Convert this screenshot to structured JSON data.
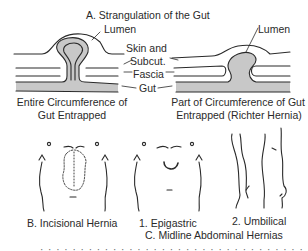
{
  "figure": {
    "panel_a": {
      "title": "A. Strangulation of the Gut",
      "left_caption": [
        "Entire Circumference of",
        "Gut Entrapped"
      ],
      "right_caption": [
        "Part of Circumference of Gut",
        "Entrapped (Richter Hernia)"
      ],
      "layer_labels": {
        "lumen_left": "Lumen",
        "lumen_right": "Lumen",
        "skin": "Skin and",
        "subcut": "Subcut.",
        "fascia": "Fascia",
        "gut": "Gut"
      }
    },
    "panel_b": {
      "label": "B. Incisional Hernia"
    },
    "panel_c": {
      "sub1": "1. Epigastric",
      "sub2": "2. Umbilical",
      "title": "C. Midline Abdominal Hernias"
    },
    "cut_off_text": "· · ·  · · · · · · · ·  · · · · · · · · ·  · · · · · · · ·  · · · · ·"
  },
  "colors": {
    "line": "#2a2a2a",
    "fill": "#c8c8c8",
    "background": "#ffffff"
  }
}
